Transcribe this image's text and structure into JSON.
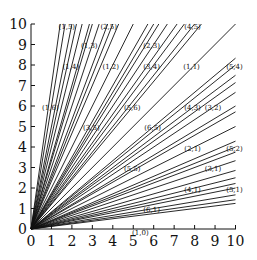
{
  "chart_data": {
    "type": "line",
    "title": "",
    "xlabel": "",
    "ylabel": "",
    "xlim": [
      0,
      10
    ],
    "ylim": [
      0,
      10
    ],
    "grid": false,
    "x_ticks": [
      "0",
      "1",
      "2",
      "3",
      "4",
      "5",
      "6",
      "7",
      "8",
      "9",
      "10"
    ],
    "y_ticks": [
      "0",
      "1",
      "2",
      "3",
      "4",
      "5",
      "6",
      "7",
      "8",
      "9",
      "10"
    ],
    "series": [
      {
        "name": "(1,6)",
        "direction": [
          1,
          6
        ]
      },
      {
        "name": "(1,5)",
        "direction": [
          1,
          5
        ]
      },
      {
        "name": "(1,4)",
        "direction": [
          1,
          4
        ]
      },
      {
        "name": "(1,3)",
        "direction": [
          1,
          3
        ]
      },
      {
        "name": "(2,5)",
        "direction": [
          2,
          5
        ]
      },
      {
        "name": "(1,2)",
        "direction": [
          1,
          2
        ]
      },
      {
        "name": "(3,5)",
        "direction": [
          3,
          5
        ]
      },
      {
        "name": "(2,3)",
        "direction": [
          2,
          3
        ]
      },
      {
        "name": "(3,4)",
        "direction": [
          3,
          4
        ]
      },
      {
        "name": "(4,5)",
        "direction": [
          4,
          5
        ]
      },
      {
        "name": "(5,6)",
        "direction": [
          5,
          6
        ]
      },
      {
        "name": "(1,1)",
        "direction": [
          1,
          1
        ]
      },
      {
        "name": "(6,5)",
        "direction": [
          6,
          5
        ]
      },
      {
        "name": "(5,4)",
        "direction": [
          5,
          4
        ]
      },
      {
        "name": "(4,3)",
        "direction": [
          4,
          3
        ]
      },
      {
        "name": "(3,2)",
        "direction": [
          3,
          2
        ]
      },
      {
        "name": "(5,3)",
        "direction": [
          5,
          3
        ]
      },
      {
        "name": "(2,1)",
        "direction": [
          2,
          1
        ]
      },
      {
        "name": "(5,2)",
        "direction": [
          5,
          2
        ]
      },
      {
        "name": "(3,1)",
        "direction": [
          3,
          1
        ]
      },
      {
        "name": "(4,1)",
        "direction": [
          4,
          1
        ]
      },
      {
        "name": "(5,1)",
        "direction": [
          5,
          1
        ]
      },
      {
        "name": "(6,1)",
        "direction": [
          6,
          1
        ]
      },
      {
        "name": "(1,0)",
        "direction": [
          1,
          0
        ]
      }
    ],
    "extra_rays": [
      [
        1,
        7
      ],
      [
        2,
        7
      ],
      [
        3,
        7
      ],
      [
        2,
        9
      ],
      [
        3,
        8
      ],
      [
        4,
        7
      ],
      [
        5,
        7
      ],
      [
        5,
        8
      ],
      [
        3,
        10
      ],
      [
        7,
        5
      ],
      [
        7,
        4
      ],
      [
        8,
        3
      ],
      [
        7,
        3
      ],
      [
        7,
        2
      ],
      [
        9,
        2
      ],
      [
        8,
        1
      ],
      [
        7,
        1
      ]
    ],
    "annotations": [
      {
        "text": "(1,5)",
        "x": 1.75,
        "y": 9.9
      },
      {
        "text": "(2,5)",
        "x": 3.8,
        "y": 9.9
      },
      {
        "text": "(4,5)",
        "x": 7.9,
        "y": 9.9
      },
      {
        "text": "(1,3)",
        "x": 2.85,
        "y": 8.95
      },
      {
        "text": "(2,3)",
        "x": 5.9,
        "y": 8.95
      },
      {
        "text": "(1,4)",
        "x": 1.95,
        "y": 7.95
      },
      {
        "text": "(1,2)",
        "x": 3.9,
        "y": 7.95
      },
      {
        "text": "(3,4)",
        "x": 5.9,
        "y": 7.95
      },
      {
        "text": "(1,1)",
        "x": 7.85,
        "y": 7.95
      },
      {
        "text": "(5,4)",
        "x": 9.95,
        "y": 7.95
      },
      {
        "text": "(1,6)",
        "x": 0.95,
        "y": 5.95
      },
      {
        "text": "(5,6)",
        "x": 4.95,
        "y": 5.95
      },
      {
        "text": "(4,3)",
        "x": 7.9,
        "y": 5.95
      },
      {
        "text": "(3,2)",
        "x": 8.9,
        "y": 5.95
      },
      {
        "text": "(3,5)",
        "x": 2.95,
        "y": 4.95
      },
      {
        "text": "(6,5)",
        "x": 5.95,
        "y": 4.95
      },
      {
        "text": "(5,5)",
        "x": 4.95,
        "y": 2.95
      },
      {
        "text": "(2,1)",
        "x": 7.9,
        "y": 3.95
      },
      {
        "text": "(5,2)",
        "x": 9.95,
        "y": 3.95
      },
      {
        "text": "(3,1)",
        "x": 8.9,
        "y": 2.95
      },
      {
        "text": "(4,1)",
        "x": 7.9,
        "y": 1.95
      },
      {
        "text": "(5,1)",
        "x": 9.95,
        "y": 1.95
      },
      {
        "text": "(6,1)",
        "x": 5.9,
        "y": 0.95
      },
      {
        "text": "(1,0)",
        "x": 5.35,
        "y": -0.15
      }
    ]
  }
}
